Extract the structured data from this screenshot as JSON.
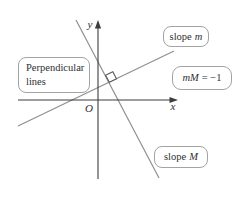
{
  "figure": {
    "colors": {
      "background": "#ffffff",
      "axis": "#3d3d3d",
      "slanted_line": "#8f8f8f",
      "marker_stroke": "#5a5a5a",
      "marker_fill": "#ffffff",
      "box_border": "#a3a3a3",
      "text": "#2f2f2f"
    },
    "axes": {
      "x_label": "x",
      "y_label": "y",
      "origin_label": "O"
    },
    "callouts": {
      "perpendicular": {
        "line1": "Perpendicular",
        "line2": "lines"
      },
      "slope_m": {
        "plain": "slope",
        "italic": "m"
      },
      "equation": {
        "lhs_italic": "mM",
        "rhs": "= −1"
      },
      "slope_M": {
        "plain": "slope",
        "italic": "M"
      }
    },
    "marker": {
      "icon": "right-angle-square"
    }
  }
}
